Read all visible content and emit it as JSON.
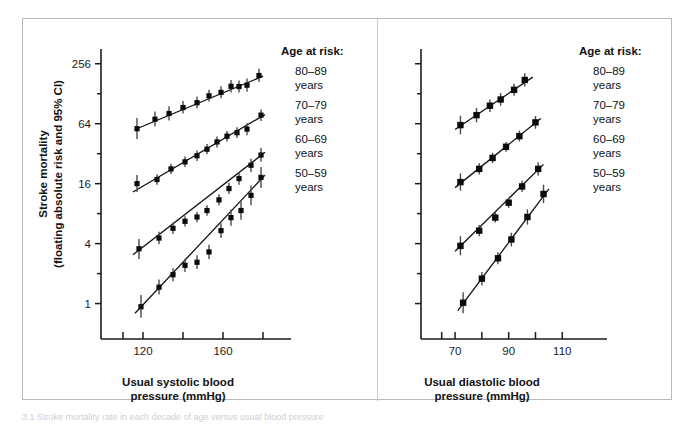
{
  "figure": {
    "caption_partial": "3.1 Stroke mortality rate in each decade of age versus usual blood pressure"
  },
  "yaxis": {
    "title_line1": "Stroke mortality",
    "title_line2": "(floating absolute risk and 95% CI)",
    "major_labels": [
      "256",
      "64",
      "16",
      "4",
      "1"
    ],
    "major_values": [
      256,
      64,
      16,
      4,
      1
    ],
    "minor_values": [
      128,
      32,
      8,
      2
    ],
    "scale": "log2",
    "range": [
      0.7,
      360
    ]
  },
  "panels": [
    {
      "name": "systolic",
      "xaxis": {
        "title_line1": "Usual systolic blood",
        "title_line2": "pressure (mmHg)",
        "labels": [
          "120",
          "160"
        ],
        "label_values": [
          120,
          160
        ],
        "tick_values": [
          110,
          120,
          140,
          160,
          180
        ],
        "range": [
          108,
          184
        ]
      },
      "legend": {
        "title": "Age at risk:",
        "items": [
          {
            "range": "80–89",
            "unit": "years"
          },
          {
            "range": "70–79",
            "unit": "years"
          },
          {
            "range": "60–69",
            "unit": "years"
          },
          {
            "range": "50–59",
            "unit": "years"
          }
        ]
      }
    },
    {
      "name": "diastolic",
      "xaxis": {
        "title_line1": "Usual diastolic blood",
        "title_line2": "pressure (mmHg)",
        "labels": [
          "70",
          "90",
          "110"
        ],
        "label_values": [
          70,
          90,
          110
        ],
        "tick_values": [
          65,
          70,
          80,
          90,
          100,
          110
        ],
        "range": [
          64,
          114
        ]
      },
      "legend": {
        "title": "Age at risk:",
        "items": [
          {
            "range": "80–89",
            "unit": "years"
          },
          {
            "range": "70–79",
            "unit": "years"
          },
          {
            "range": "60–69",
            "unit": "years"
          },
          {
            "range": "50–59",
            "unit": "years"
          }
        ]
      }
    }
  ],
  "chart_data": {
    "type": "scatter",
    "title": "",
    "xlabel": "Usual systolic / diastolic blood pressure (mmHg)",
    "ylabel": "Stroke mortality (floating absolute risk and 95% CI)",
    "yscale": "log2",
    "ylim": [
      0.7,
      360
    ],
    "grid": false,
    "legend_position": "right",
    "panels": [
      {
        "panel": "systolic",
        "xlabel": "Usual systolic blood pressure (mmHg)",
        "xlim": [
          108,
          184
        ],
        "series": [
          {
            "name": "80–89 years",
            "points": [
              {
                "x": 117,
                "y": 57,
                "ci_low": 45,
                "ci_high": 73
              },
              {
                "x": 126,
                "y": 71,
                "ci_low": 60,
                "ci_high": 85
              },
              {
                "x": 133,
                "y": 81,
                "ci_low": 69,
                "ci_high": 96
              },
              {
                "x": 140,
                "y": 93,
                "ci_low": 81,
                "ci_high": 108
              },
              {
                "x": 147,
                "y": 104,
                "ci_low": 91,
                "ci_high": 120
              },
              {
                "x": 153,
                "y": 122,
                "ci_low": 107,
                "ci_high": 140
              },
              {
                "x": 159,
                "y": 132,
                "ci_low": 115,
                "ci_high": 152
              },
              {
                "x": 164,
                "y": 152,
                "ci_low": 132,
                "ci_high": 176
              },
              {
                "x": 168,
                "y": 151,
                "ci_low": 132,
                "ci_high": 174
              },
              {
                "x": 172,
                "y": 156,
                "ci_low": 134,
                "ci_high": 182
              },
              {
                "x": 178,
                "y": 195,
                "ci_low": 168,
                "ci_high": 228
              }
            ],
            "fit": {
              "x1": 116,
              "y1": 56,
              "x2": 180,
              "y2": 192
            }
          },
          {
            "name": "70–79 years",
            "points": [
              {
                "x": 117,
                "y": 16.0,
                "ci_low": 13.2,
                "ci_high": 19.5
              },
              {
                "x": 127,
                "y": 17.6,
                "ci_low": 15.6,
                "ci_high": 19.9
              },
              {
                "x": 134,
                "y": 22.5,
                "ci_low": 20.0,
                "ci_high": 25.4
              },
              {
                "x": 141,
                "y": 26.5,
                "ci_low": 23.5,
                "ci_high": 30.0
              },
              {
                "x": 147,
                "y": 30.5,
                "ci_low": 27.0,
                "ci_high": 34.5
              },
              {
                "x": 152,
                "y": 35.5,
                "ci_low": 31.5,
                "ci_high": 40.0
              },
              {
                "x": 157,
                "y": 42.0,
                "ci_low": 37.0,
                "ci_high": 47.5
              },
              {
                "x": 162,
                "y": 48.0,
                "ci_low": 42.5,
                "ci_high": 54.0
              },
              {
                "x": 167,
                "y": 52.0,
                "ci_low": 46.0,
                "ci_high": 59.0
              },
              {
                "x": 172,
                "y": 56.5,
                "ci_low": 49.0,
                "ci_high": 65.0
              },
              {
                "x": 179,
                "y": 78.0,
                "ci_low": 68.0,
                "ci_high": 89.0
              }
            ],
            "fit": {
              "x1": 115,
              "y1": 13.2,
              "x2": 181,
              "y2": 79.0
            }
          },
          {
            "name": "60–69 years",
            "points": [
              {
                "x": 118,
                "y": 3.55,
                "ci_low": 2.8,
                "ci_high": 4.45
              },
              {
                "x": 128,
                "y": 4.55,
                "ci_low": 3.95,
                "ci_high": 5.25
              },
              {
                "x": 135,
                "y": 5.7,
                "ci_low": 5.0,
                "ci_high": 6.5
              },
              {
                "x": 141,
                "y": 6.7,
                "ci_low": 5.95,
                "ci_high": 7.55
              },
              {
                "x": 147,
                "y": 7.4,
                "ci_low": 6.55,
                "ci_high": 8.35
              },
              {
                "x": 152,
                "y": 8.6,
                "ci_low": 7.6,
                "ci_high": 9.7
              },
              {
                "x": 158,
                "y": 11.0,
                "ci_low": 9.7,
                "ci_high": 12.5
              },
              {
                "x": 163,
                "y": 14.3,
                "ci_low": 12.6,
                "ci_high": 16.3
              },
              {
                "x": 168,
                "y": 18.0,
                "ci_low": 15.6,
                "ci_high": 20.8
              },
              {
                "x": 174,
                "y": 24.5,
                "ci_low": 21.0,
                "ci_high": 28.5
              },
              {
                "x": 179,
                "y": 31.0,
                "ci_low": 26.5,
                "ci_high": 36.5
              }
            ],
            "fit": {
              "x1": 115,
              "y1": 3.1,
              "x2": 181,
              "y2": 33.0
            }
          },
          {
            "name": "50–59 years",
            "points": [
              {
                "x": 119,
                "y": 0.93,
                "ci_low": 0.72,
                "ci_high": 1.22
              },
              {
                "x": 128,
                "y": 1.46,
                "ci_low": 1.23,
                "ci_high": 1.74
              },
              {
                "x": 135,
                "y": 1.95,
                "ci_low": 1.68,
                "ci_high": 2.26
              },
              {
                "x": 141,
                "y": 2.42,
                "ci_low": 2.08,
                "ci_high": 2.82
              },
              {
                "x": 147,
                "y": 2.6,
                "ci_low": 2.22,
                "ci_high": 3.05
              },
              {
                "x": 153,
                "y": 3.3,
                "ci_low": 2.8,
                "ci_high": 3.9
              },
              {
                "x": 159,
                "y": 5.4,
                "ci_low": 4.55,
                "ci_high": 6.4
              },
              {
                "x": 164,
                "y": 7.3,
                "ci_low": 6.05,
                "ci_high": 8.8
              },
              {
                "x": 169,
                "y": 8.6,
                "ci_low": 6.95,
                "ci_high": 10.6
              },
              {
                "x": 174,
                "y": 12.2,
                "ci_low": 9.7,
                "ci_high": 15.3
              },
              {
                "x": 179,
                "y": 18.5,
                "ci_low": 14.5,
                "ci_high": 23.5
              }
            ],
            "fit": {
              "x1": 116,
              "y1": 0.8,
              "x2": 181,
              "y2": 19.5
            }
          }
        ]
      },
      {
        "panel": "diastolic",
        "xlabel": "Usual diastolic blood pressure (mmHg)",
        "xlim": [
          64,
          114
        ],
        "series": [
          {
            "name": "80–89 years",
            "points": [
              {
                "x": 72,
                "y": 62,
                "ci_low": 50,
                "ci_high": 77
              },
              {
                "x": 78,
                "y": 78,
                "ci_low": 66,
                "ci_high": 92
              },
              {
                "x": 83,
                "y": 97,
                "ci_low": 84,
                "ci_high": 112
              },
              {
                "x": 87,
                "y": 112,
                "ci_low": 97,
                "ci_high": 130
              },
              {
                "x": 92,
                "y": 140,
                "ci_low": 122,
                "ci_high": 161
              },
              {
                "x": 96,
                "y": 176,
                "ci_low": 151,
                "ci_high": 205
              }
            ],
            "fit": {
              "x1": 70,
              "y1": 56,
              "x2": 99,
              "y2": 188
            }
          },
          {
            "name": "70–79 years",
            "points": [
              {
                "x": 72,
                "y": 16.6,
                "ci_low": 13.6,
                "ci_high": 20.3
              },
              {
                "x": 79,
                "y": 22.5,
                "ci_low": 19.8,
                "ci_high": 25.6
              },
              {
                "x": 84,
                "y": 29.0,
                "ci_low": 25.8,
                "ci_high": 32.6
              },
              {
                "x": 89,
                "y": 37.5,
                "ci_low": 33.5,
                "ci_high": 42.0
              },
              {
                "x": 94,
                "y": 48.0,
                "ci_low": 42.5,
                "ci_high": 54.5
              },
              {
                "x": 100,
                "y": 66.0,
                "ci_low": 57.0,
                "ci_high": 76.5
              }
            ],
            "fit": {
              "x1": 70,
              "y1": 14.6,
              "x2": 102,
              "y2": 72.0
            }
          },
          {
            "name": "60–69 years",
            "points": [
              {
                "x": 72,
                "y": 3.8,
                "ci_low": 3.05,
                "ci_high": 4.75
              },
              {
                "x": 79,
                "y": 5.4,
                "ci_low": 4.75,
                "ci_high": 6.15
              },
              {
                "x": 85,
                "y": 7.3,
                "ci_low": 6.5,
                "ci_high": 8.2
              },
              {
                "x": 90,
                "y": 10.3,
                "ci_low": 9.15,
                "ci_high": 11.6
              },
              {
                "x": 95,
                "y": 15.0,
                "ci_low": 13.2,
                "ci_high": 17.1
              },
              {
                "x": 101,
                "y": 22.5,
                "ci_low": 19.3,
                "ci_high": 26.2
              }
            ],
            "fit": {
              "x1": 70,
              "y1": 3.35,
              "x2": 103,
              "y2": 25.0
            }
          },
          {
            "name": "50–59 years",
            "points": [
              {
                "x": 73,
                "y": 1.02,
                "ci_low": 0.8,
                "ci_high": 1.3
              },
              {
                "x": 80,
                "y": 1.78,
                "ci_low": 1.52,
                "ci_high": 2.08
              },
              {
                "x": 86,
                "y": 2.85,
                "ci_low": 2.48,
                "ci_high": 3.28
              },
              {
                "x": 91,
                "y": 4.4,
                "ci_low": 3.75,
                "ci_high": 5.15
              },
              {
                "x": 97,
                "y": 7.4,
                "ci_low": 6.2,
                "ci_high": 8.85
              },
              {
                "x": 103,
                "y": 12.6,
                "ci_low": 10.2,
                "ci_high": 15.6
              }
            ],
            "fit": {
              "x1": 71,
              "y1": 0.85,
              "x2": 105,
              "y2": 14.2
            }
          }
        ]
      }
    ]
  }
}
